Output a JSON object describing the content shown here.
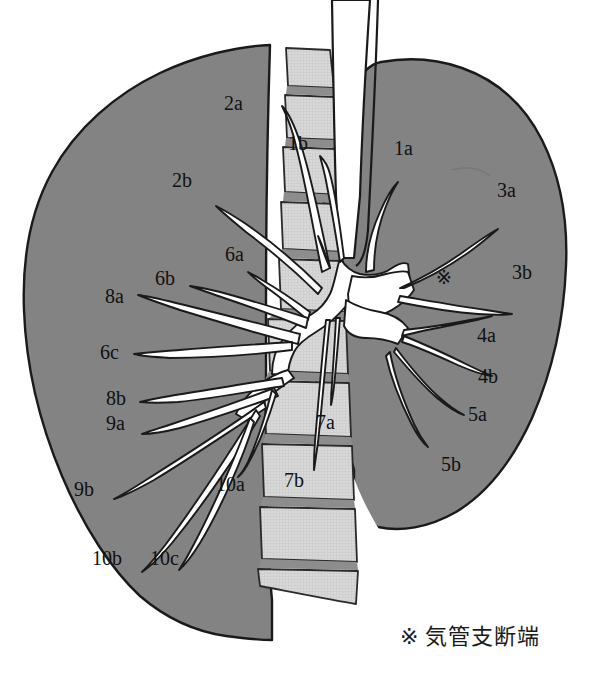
{
  "figure": {
    "type": "anatomical-diagram",
    "colors": {
      "background": "#ffffff",
      "lung_fill": "#838383",
      "lung_outline": "#1a1a1a",
      "vertebra_fill": "#d9d9d9",
      "vertebra_disc": "#8d8d8d",
      "vertebra_outline": "#2a2a2a",
      "airway_fill": "#ffffff",
      "airway_outline": "#1a1a1a",
      "label_text": "#111111"
    }
  },
  "labels": [
    {
      "id": "2a",
      "text": "2a",
      "x": 224,
      "y": 93,
      "side": "left"
    },
    {
      "id": "1b",
      "text": "1b",
      "x": 288,
      "y": 133,
      "side": "center"
    },
    {
      "id": "1a",
      "text": "1a",
      "x": 394,
      "y": 138,
      "side": "right"
    },
    {
      "id": "2b",
      "text": "2b",
      "x": 172,
      "y": 170,
      "side": "left"
    },
    {
      "id": "3a",
      "text": "3a",
      "x": 497,
      "y": 180,
      "side": "right"
    },
    {
      "id": "6a",
      "text": "6a",
      "x": 225,
      "y": 244,
      "side": "left"
    },
    {
      "id": "3b",
      "text": "3b",
      "x": 512,
      "y": 262,
      "side": "right"
    },
    {
      "id": "6b",
      "text": "6b",
      "x": 155,
      "y": 268,
      "side": "left"
    },
    {
      "id": "8a",
      "text": "8a",
      "x": 105,
      "y": 286,
      "side": "left"
    },
    {
      "id": "4a",
      "text": "4a",
      "x": 477,
      "y": 325,
      "side": "right"
    },
    {
      "id": "6c",
      "text": "6c",
      "x": 100,
      "y": 342,
      "side": "left"
    },
    {
      "id": "4b",
      "text": "4b",
      "x": 478,
      "y": 366,
      "side": "right"
    },
    {
      "id": "8b",
      "text": "8b",
      "x": 106,
      "y": 388,
      "side": "left"
    },
    {
      "id": "9a",
      "text": "9a",
      "x": 106,
      "y": 413,
      "side": "left"
    },
    {
      "id": "7a",
      "text": "7a",
      "x": 316,
      "y": 412,
      "side": "center"
    },
    {
      "id": "5a",
      "text": "5a",
      "x": 468,
      "y": 404,
      "side": "right"
    },
    {
      "id": "5b",
      "text": "5b",
      "x": 441,
      "y": 454,
      "side": "right"
    },
    {
      "id": "9b",
      "text": "9b",
      "x": 74,
      "y": 479,
      "side": "left"
    },
    {
      "id": "10a",
      "text": "10a",
      "x": 216,
      "y": 474,
      "side": "left"
    },
    {
      "id": "7b",
      "text": "7b",
      "x": 284,
      "y": 470,
      "side": "center"
    },
    {
      "id": "10b",
      "text": "10b",
      "x": 92,
      "y": 548,
      "side": "left"
    },
    {
      "id": "10c",
      "text": "10c",
      "x": 150,
      "y": 548,
      "side": "left"
    }
  ],
  "reference_mark": {
    "symbol": "※",
    "x": 436,
    "y": 266
  },
  "legend": {
    "symbol": "※",
    "text": "気管支断端"
  }
}
